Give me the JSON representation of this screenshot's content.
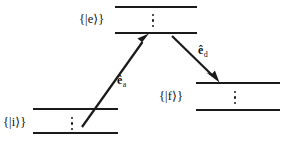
{
  "figure": {
    "type": "energy-level-diagram",
    "width": 284,
    "height": 144,
    "background_color": "#ffffff",
    "ink_color": "#1a1a1a"
  },
  "manifolds": [
    {
      "id": "e",
      "label": "{|e⟩}",
      "role": "excited-state-manifold",
      "continuum_marker": "⋮",
      "upper_line": {
        "x1": 115,
        "y": 7,
        "x2": 197
      },
      "lower_line": {
        "x1": 115,
        "y": 33,
        "x2": 197
      },
      "label_position": {
        "x": 79,
        "y": 13
      },
      "dots_position": {
        "x": 155,
        "y": 14
      }
    },
    {
      "id": "f",
      "label": "{|f⟩}",
      "role": "final-state-manifold",
      "continuum_marker": "⋮",
      "upper_line": {
        "x1": 196,
        "y": 83,
        "x2": 280
      },
      "lower_line": {
        "x1": 196,
        "y": 110,
        "x2": 280
      },
      "label_position": {
        "x": 159,
        "y": 90
      },
      "dots_position": {
        "x": 237,
        "y": 91
      }
    },
    {
      "id": "i",
      "label": "{|i⟩}",
      "role": "initial-state-manifold",
      "continuum_marker": "⋮",
      "upper_line": {
        "x1": 33,
        "y": 109,
        "x2": 118
      },
      "lower_line": {
        "x1": 33,
        "y": 133,
        "x2": 118
      },
      "label_position": {
        "x": 3,
        "y": 116
      },
      "dots_position": {
        "x": 74,
        "y": 117
      }
    }
  ],
  "transitions": [
    {
      "id": "absorption",
      "label_base": "ê",
      "label_sub": "a",
      "from_manifold": "i",
      "to_manifold": "e",
      "direction": "up-right",
      "start": {
        "x": 82,
        "y": 127
      },
      "end": {
        "x": 149,
        "y": 34
      },
      "label_position": {
        "x": 117,
        "y": 74
      }
    },
    {
      "id": "emission",
      "label_base": "ê",
      "label_sub": "d",
      "from_manifold": "e",
      "to_manifold": "f",
      "direction": "down-right",
      "start": {
        "x": 172,
        "y": 36
      },
      "end": {
        "x": 219,
        "y": 82
      },
      "label_position": {
        "x": 198,
        "y": 44
      }
    }
  ]
}
